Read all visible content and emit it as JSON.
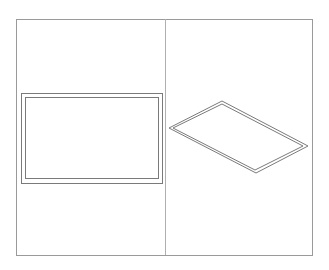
{
  "drawing": {
    "frame": {
      "x": 16,
      "y": 19,
      "width": 296,
      "height": 236,
      "stroke": "#9a9a9a"
    },
    "divider": {
      "x": 165,
      "y1": 19,
      "y2": 255,
      "stroke": "#b0b0b0"
    },
    "front_view": {
      "outer": {
        "x": 21,
        "y": 93,
        "width": 141,
        "height": 90
      },
      "inner": {
        "x": 25,
        "y": 97,
        "width": 133,
        "height": 81
      },
      "stroke": "#7a7a7a"
    },
    "isometric_view": {
      "outer": [
        [
          169,
          128
        ],
        [
          222,
          101
        ],
        [
          308,
          146
        ],
        [
          256,
          173
        ]
      ],
      "inner": [
        [
          173,
          128
        ],
        [
          222,
          104
        ],
        [
          303,
          146
        ],
        [
          255,
          170
        ]
      ],
      "stroke": "#7a7a7a"
    }
  }
}
